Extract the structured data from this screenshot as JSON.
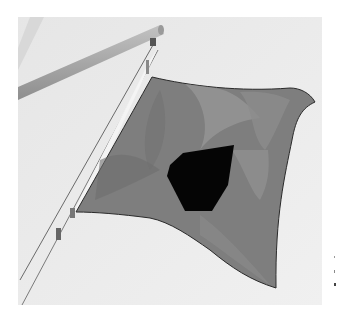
{
  "image": {
    "description": "Grayscale photograph of a signal flag (dark field with a black square-like center) flying from a halyard beside a diagonal spar against a pale sky",
    "colors": {
      "background": "#ffffff",
      "sky": "#ececec",
      "spar": "#a9a9a9",
      "flag_field": "#7e7e7e",
      "flag_highlight": "#989898",
      "flag_shadow": "#6a6a6a",
      "center_square": "#050505",
      "halyard": "#6d6d6d"
    }
  }
}
